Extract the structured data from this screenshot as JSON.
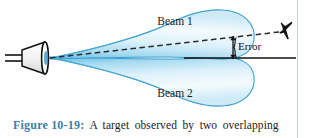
{
  "figure": {
    "caption_number": "Figure 10-19:",
    "caption_text": "A target observed by two overlapping",
    "caption_number_color": "#3a7fa8",
    "background_color": "#ffffff",
    "rule_color": "#bcd9ea",
    "rule_x": 297
  },
  "diagram": {
    "antenna": {
      "name": "horn antenna",
      "color": "#111111",
      "apex_x": 48,
      "apex_y": 58
    },
    "beams": [
      {
        "id": "beam-1",
        "label": "Beam 1",
        "label_x": 175,
        "label_y": 25,
        "position": "upper",
        "outline_color": "#3f9fd0",
        "fill_light": "#eaf6fc",
        "fill_mid": "#bfe3f4",
        "fill_deep": "#7cc8e8"
      },
      {
        "id": "beam-2",
        "label": "Beam 2",
        "label_x": 175,
        "label_y": 96,
        "position": "lower",
        "outline_color": "#3f9fd0",
        "fill_light": "#eaf6fc",
        "fill_mid": "#bfe3f4",
        "fill_deep": "#7cc8e8"
      }
    ],
    "boresight_line": {
      "name": "boresight axis",
      "style": "solid",
      "color": "#111111",
      "x1": 185,
      "y1": 58,
      "x2": 296,
      "y2": 58
    },
    "target_line": {
      "name": "target line of sight",
      "style": "dashed",
      "color": "#2b2b2b",
      "x1": 50,
      "y1": 58,
      "x2": 278,
      "y2": 33
    },
    "error_annotation": {
      "label": "Error",
      "label_x": 239,
      "label_y": 49,
      "arrow_x": 233,
      "arrow_top_y": 37,
      "arrow_bottom_y": 57,
      "color": "#141414"
    },
    "target": {
      "name": "aircraft target",
      "glyph": "airplane",
      "x": 288,
      "y": 31,
      "color": "#111111"
    }
  }
}
